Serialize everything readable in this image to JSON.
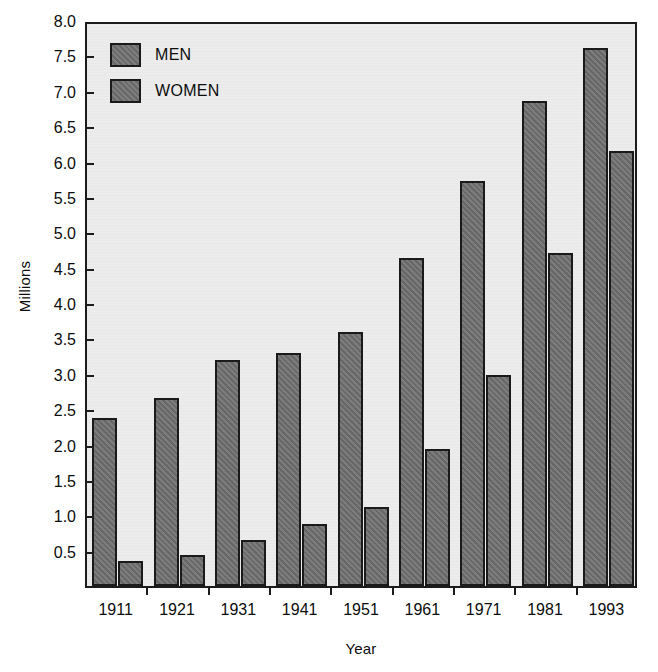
{
  "chart_data": {
    "type": "bar",
    "title": "",
    "xlabel": "Year",
    "ylabel": "Millions",
    "categories": [
      "1911",
      "1921",
      "1931",
      "1941",
      "1951",
      "1961",
      "1971",
      "1981",
      "1993"
    ],
    "series": [
      {
        "name": "MEN",
        "color": "#6e6e6e",
        "values": [
          2.38,
          2.66,
          3.19,
          3.3,
          3.59,
          4.63,
          5.72,
          6.85,
          7.61
        ]
      },
      {
        "name": "WOMEN",
        "color": "#6e6e6e",
        "values": [
          0.36,
          0.44,
          0.65,
          0.88,
          1.11,
          1.93,
          2.98,
          4.7,
          6.15
        ]
      }
    ],
    "ylim": [
      0.0,
      8.0
    ],
    "ytick_labels": [
      "8.0",
      "7.5",
      "7.0",
      "6.5",
      "6.0",
      "5.5",
      "5.0",
      "4.5",
      "4.0",
      "3.5",
      "3.0",
      "2.5",
      "2.0",
      "1.5",
      "1.0",
      "0.5"
    ],
    "ytick_values": [
      8.0,
      7.5,
      7.0,
      6.5,
      6.0,
      5.5,
      5.0,
      4.5,
      4.0,
      3.5,
      3.0,
      2.5,
      2.0,
      1.5,
      1.0,
      0.5
    ],
    "grid": false,
    "legend_position": "top-left",
    "plot_background": "#ececec",
    "axis_color": "#1c1c1c"
  }
}
